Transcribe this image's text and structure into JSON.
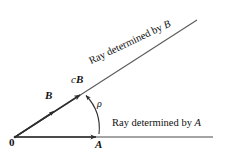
{
  "figure": {
    "background_color": "#ffffff",
    "line_color": "#3a3a3a",
    "text_color": "#111111",
    "width": 226,
    "height": 152
  },
  "labels": {
    "origin": "0",
    "point_a": "A",
    "vector_b": "B",
    "scaled_vector_c": "c",
    "scaled_vector_b": "B",
    "angle": "ρ",
    "ray_a_text": "Ray determined by ",
    "ray_a_var": "A",
    "ray_b_text": "Ray determined by ",
    "ray_b_var": "B"
  },
  "geometry": {
    "origin": [
      15,
      137
    ],
    "point_a": [
      99,
      137
    ],
    "point_cb": [
      84,
      92
    ],
    "horizontal_ray_end": [
      213,
      137
    ],
    "diagonal_ray_end": [
      197,
      20
    ],
    "vector_b_arrow_tip": [
      57,
      108
    ],
    "angle_arc_start": [
      85,
      95
    ],
    "angle_arc_end": [
      99,
      131
    ],
    "diagonal_angle_deg": -25.5
  }
}
